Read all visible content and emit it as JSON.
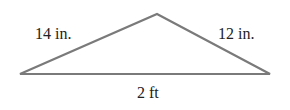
{
  "diagram": {
    "type": "triangle",
    "vertices": {
      "left": [
        20,
        74
      ],
      "apex": [
        157,
        14
      ],
      "right": [
        270,
        74
      ]
    },
    "stroke_color": "#7a7a7a",
    "labels": {
      "left_side": "14 in.",
      "right_side": "12 in.",
      "base": "2 ft"
    }
  }
}
